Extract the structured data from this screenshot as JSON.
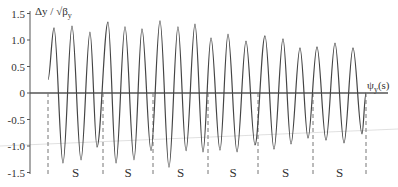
{
  "chart_data": {
    "type": "line",
    "title": "",
    "ylabel": "Δy / √β_y",
    "xlabel": "ψ_y(s)",
    "ylim": [
      -1.5,
      1.5
    ],
    "yticks": [
      1.5,
      1.0,
      0.5,
      0,
      -0.5,
      -1.0,
      -1.5
    ],
    "ytick_labels": [
      "1.5",
      "1.0",
      "0.5",
      "0",
      "-0.5",
      "-1.0",
      "-1.5"
    ],
    "grid": false,
    "legend": null,
    "series": [
      {
        "name": "orbit",
        "color": "#444444",
        "points": [
          [
            48,
            0.25
          ],
          [
            54,
            1.23
          ],
          [
            63,
            -1.32
          ],
          [
            72,
            1.26
          ],
          [
            81,
            -1.26
          ],
          [
            90,
            1.15
          ],
          [
            97,
            -1.02
          ],
          [
            108,
            1.34
          ],
          [
            116,
            -1.32
          ],
          [
            125,
            1.25
          ],
          [
            134,
            -1.26
          ],
          [
            142,
            1.21
          ],
          [
            151,
            -1.09
          ],
          [
            160,
            1.36
          ],
          [
            169,
            -1.4
          ],
          [
            178,
            1.25
          ],
          [
            186,
            -1.09
          ],
          [
            195,
            1.3
          ],
          [
            203,
            -1.11
          ],
          [
            211,
            1.04
          ],
          [
            220,
            -1.08
          ],
          [
            228,
            1.11
          ],
          [
            237,
            -1.11
          ],
          [
            246,
            0.98
          ],
          [
            255,
            -0.98
          ],
          [
            265,
            1.08
          ],
          [
            274,
            -1.06
          ],
          [
            283,
            1.02
          ],
          [
            291,
            -0.96
          ],
          [
            300,
            0.85
          ],
          [
            308,
            -0.85
          ],
          [
            317,
            0.87
          ],
          [
            326,
            -0.89
          ],
          [
            335,
            0.94
          ],
          [
            344,
            -0.94
          ],
          [
            353,
            0.85
          ],
          [
            362,
            -0.77
          ],
          [
            366,
            0.0
          ]
        ]
      }
    ],
    "section_markers_x_px": [
      48,
      103,
      153,
      208,
      258,
      313,
      366
    ],
    "section_labels": [
      "S",
      "S",
      "S",
      "S",
      "S",
      "S"
    ],
    "annotations": [
      "S sections between dashed vertical lines"
    ]
  },
  "labels": {
    "y_axis_title": "Δy / √β",
    "y_axis_sub": "y",
    "x_axis_title": "ψ",
    "x_axis_sub": "y",
    "x_axis_suffix": "(s)",
    "ticks": [
      "1.5",
      "1.0",
      "0.5",
      "0",
      "-0.5",
      "-1.0",
      "-1.5"
    ],
    "sections": [
      "S",
      "S",
      "S",
      "S",
      "S",
      "S"
    ]
  }
}
